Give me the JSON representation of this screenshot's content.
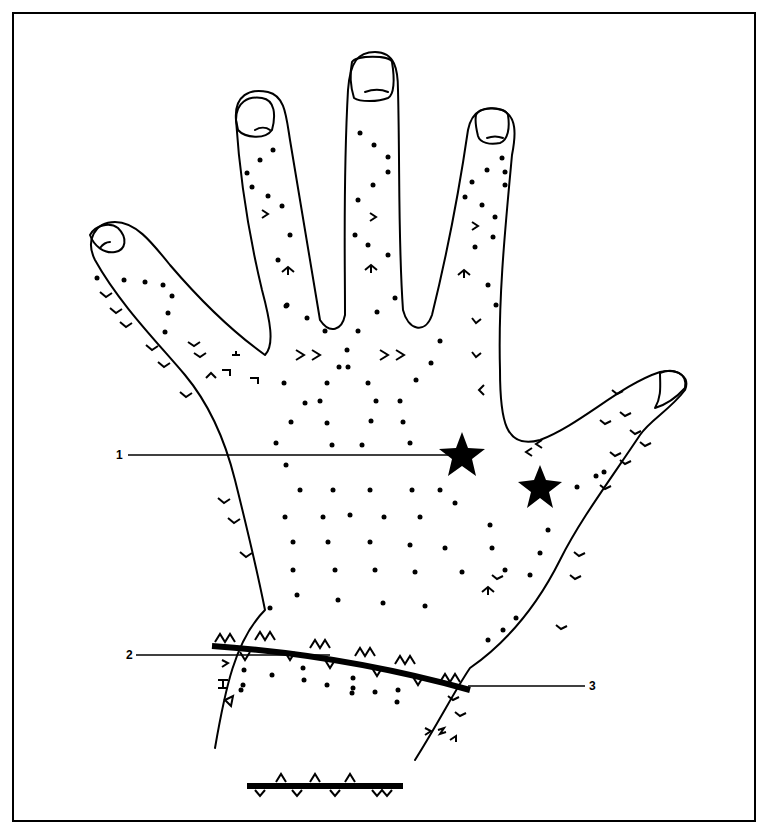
{
  "figure": {
    "line_color": "#000000",
    "background": "#ffffff",
    "labels": [
      {
        "id": "1",
        "text": "1",
        "points_to": "star-marker-palm"
      },
      {
        "id": "2",
        "text": "2",
        "points_to": "wrist-band-left"
      },
      {
        "id": "3",
        "text": "3",
        "points_to": "wrist-band-right"
      }
    ],
    "legend_bar": "scale-bar-with-markers"
  }
}
